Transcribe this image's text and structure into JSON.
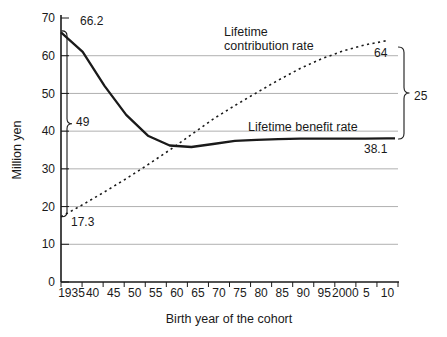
{
  "chart_data": {
    "type": "line",
    "title": "",
    "xlabel": "Birth year of the cohort",
    "ylabel": "Million yen",
    "ylim": [
      0,
      70
    ],
    "yticks": [
      0,
      10,
      20,
      30,
      40,
      50,
      60,
      70
    ],
    "grid": "horizontal gridlines at 10-60, light gray",
    "legend_position": "inline labels next to curves",
    "x_tick_labels": [
      "1935",
      "40",
      "45",
      "50",
      "55",
      "60",
      "65",
      "70",
      "75",
      "80",
      "85",
      "90",
      "95",
      "2000",
      "5",
      "10"
    ],
    "years": [
      1935,
      1940,
      1945,
      1950,
      1955,
      1960,
      1965,
      1970,
      1975,
      1980,
      1985,
      1990,
      1995,
      2000,
      2005,
      2010
    ],
    "series": [
      {
        "name": "Lifetime contribution rate",
        "line_style": "dashed",
        "values": [
          17.3,
          20.5,
          23.9,
          27.4,
          31.1,
          35.0,
          39.1,
          43.2,
          46.8,
          50.2,
          53.5,
          56.6,
          59.2,
          61.3,
          62.9,
          64.0
        ],
        "start_label": "17.3",
        "end_label": "64"
      },
      {
        "name": "Lifetime benefit rate",
        "line_style": "solid",
        "values": [
          66.2,
          61.0,
          52.0,
          44.3,
          38.8,
          36.2,
          35.8,
          36.6,
          37.4,
          37.7,
          37.9,
          38.0,
          38.0,
          38.0,
          38.0,
          38.1
        ],
        "start_label": "66.2",
        "end_label": "38.1"
      }
    ],
    "annotations": {
      "benefit_start": "66.2",
      "benefit_end": "38.1",
      "contribution_start": "17.3",
      "contribution_end": "64",
      "left_brace_gap": "49",
      "right_brace_gap": "25"
    },
    "colors": {
      "line": "#1a1a1a",
      "gridline": "#b0b0b0",
      "background": "#ffffff"
    }
  },
  "labels": {
    "contribution_line1": "Lifetime",
    "contribution_line2": "contribution rate",
    "benefit": "Lifetime benefit rate",
    "y_axis": "Million yen",
    "x_axis": "Birth year of the cohort"
  }
}
